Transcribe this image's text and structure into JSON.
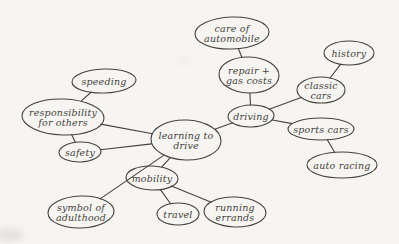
{
  "diagram": {
    "paper_color": "#f6f5f2",
    "ink_color": "#45423c",
    "nodes": [
      {
        "id": "care-of-automobile",
        "lines": [
          "care of",
          "automobile"
        ],
        "cx": 232,
        "cy": 33,
        "rx": 37,
        "ry": 16
      },
      {
        "id": "history",
        "lines": [
          "history"
        ],
        "cx": 349,
        "cy": 53,
        "rx": 25,
        "ry": 12
      },
      {
        "id": "repair-gas-costs",
        "lines": [
          "repair +",
          "gas costs"
        ],
        "cx": 249,
        "cy": 75,
        "rx": 30,
        "ry": 18
      },
      {
        "id": "speeding",
        "lines": [
          "speeding"
        ],
        "cx": 104,
        "cy": 81,
        "rx": 32,
        "ry": 12
      },
      {
        "id": "classic-cars",
        "lines": [
          "classic",
          "cars"
        ],
        "cx": 321,
        "cy": 90,
        "rx": 24,
        "ry": 13
      },
      {
        "id": "responsibility-for-others",
        "lines": [
          "responsibility",
          "for others"
        ],
        "cx": 63,
        "cy": 117,
        "rx": 41,
        "ry": 18
      },
      {
        "id": "driving",
        "lines": [
          "driving"
        ],
        "cx": 251,
        "cy": 116,
        "rx": 23,
        "ry": 11
      },
      {
        "id": "sports-cars",
        "lines": [
          "sports cars"
        ],
        "cx": 321,
        "cy": 129,
        "rx": 33,
        "ry": 11
      },
      {
        "id": "learning-to-drive",
        "lines": [
          "learning to",
          "drive"
        ],
        "cx": 186,
        "cy": 140,
        "rx": 35,
        "ry": 20
      },
      {
        "id": "safety",
        "lines": [
          "safety"
        ],
        "cx": 80,
        "cy": 152,
        "rx": 21,
        "ry": 10
      },
      {
        "id": "auto-racing",
        "lines": [
          "auto racing"
        ],
        "cx": 342,
        "cy": 165,
        "rx": 35,
        "ry": 13
      },
      {
        "id": "mobility",
        "lines": [
          "mobility"
        ],
        "cx": 152,
        "cy": 178,
        "rx": 26,
        "ry": 12
      },
      {
        "id": "symbol-of-adulthood",
        "lines": [
          "symbol of",
          "adulthood"
        ],
        "cx": 81,
        "cy": 212,
        "rx": 33,
        "ry": 16
      },
      {
        "id": "travel",
        "lines": [
          "travel"
        ],
        "cx": 178,
        "cy": 214,
        "rx": 21,
        "ry": 11
      },
      {
        "id": "running-errands",
        "lines": [
          "running",
          "errands"
        ],
        "cx": 235,
        "cy": 212,
        "rx": 31,
        "ry": 15
      }
    ],
    "edges": [
      {
        "from": "speeding",
        "to": "responsibility-for-others"
      },
      {
        "from": "responsibility-for-others",
        "to": "learning-to-drive"
      },
      {
        "from": "responsibility-for-others",
        "to": "safety"
      },
      {
        "from": "safety",
        "to": "learning-to-drive"
      },
      {
        "from": "learning-to-drive",
        "to": "driving"
      },
      {
        "from": "learning-to-drive",
        "to": "mobility"
      },
      {
        "from": "learning-to-drive",
        "to": "symbol-of-adulthood"
      },
      {
        "from": "mobility",
        "to": "travel"
      },
      {
        "from": "mobility",
        "to": "running-errands"
      },
      {
        "from": "driving",
        "to": "repair-gas-costs"
      },
      {
        "from": "repair-gas-costs",
        "to": "care-of-automobile"
      },
      {
        "from": "driving",
        "to": "classic-cars"
      },
      {
        "from": "classic-cars",
        "to": "history"
      },
      {
        "from": "driving",
        "to": "sports-cars"
      },
      {
        "from": "sports-cars",
        "to": "auto-racing"
      }
    ]
  }
}
